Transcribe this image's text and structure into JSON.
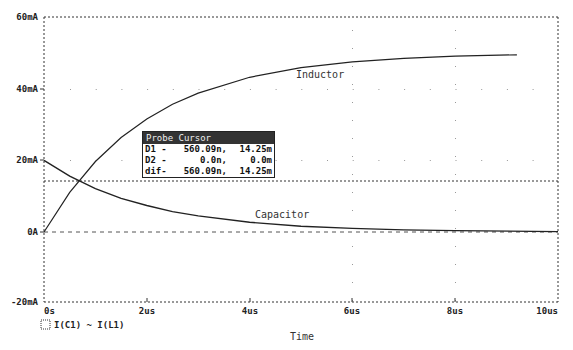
{
  "chart_data": {
    "type": "line",
    "title": "",
    "xlabel": "Time",
    "ylabel": "",
    "xlim_us": [
      0,
      10
    ],
    "ylim_mA": [
      -20,
      60
    ],
    "x_ticks": [
      "0s",
      "2us",
      "4us",
      "6us",
      "8us",
      "10us"
    ],
    "y_ticks": [
      "60mA",
      "40mA",
      "20mA",
      "0A",
      "-20mA"
    ],
    "grid": "dotted",
    "legend": [
      "I(C1)",
      "I(L1)"
    ],
    "series": [
      {
        "name": "I(L1)",
        "label": "Inductor",
        "t_us": [
          0,
          0.5,
          1,
          1.5,
          2,
          2.5,
          3,
          4,
          5,
          6,
          7,
          8,
          9.2
        ],
        "values_mA": [
          0,
          11.1,
          19.7,
          26.4,
          31.6,
          35.7,
          38.8,
          43.2,
          45.9,
          47.5,
          48.5,
          49.1,
          49.5
        ]
      },
      {
        "name": "I(C1)",
        "label": "Capacitor",
        "t_us": [
          0,
          0.5,
          1,
          1.5,
          2,
          2.5,
          3,
          4,
          5,
          6,
          7,
          8,
          10
        ],
        "values_mA": [
          20,
          15.6,
          12.1,
          9.4,
          7.4,
          5.7,
          4.5,
          2.7,
          1.6,
          1.0,
          0.6,
          0.4,
          0.1
        ]
      }
    ],
    "annotations": [
      "Inductor",
      "Capacitor"
    ],
    "cursor": {
      "x_us": 0.56,
      "y_mA": 14.25
    }
  },
  "labels": {
    "y": [
      "60mA",
      "40mA",
      "20mA",
      "0A",
      "-20mA"
    ],
    "x": [
      "0s",
      "2us",
      "4us",
      "6us",
      "8us",
      "10us"
    ],
    "xlabel": "Time",
    "inductor": "Inductor",
    "capacitor": "Capacitor",
    "legend": "I(C1)  ~ I(L1)"
  },
  "probe": {
    "title": "Probe Cursor",
    "rows": [
      {
        "name": "D1 -",
        "x": "560.09n,",
        "y": "14.25m"
      },
      {
        "name": "D2 -",
        "x": "0.0n,",
        "y": "0.0m"
      },
      {
        "name": "dif-",
        "x": "560.09n,",
        "y": "14.25m"
      }
    ]
  }
}
